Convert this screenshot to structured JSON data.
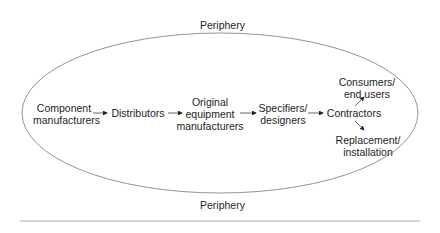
{
  "diagram": {
    "boundary_label_top": "Periphery",
    "boundary_label_bottom": "Periphery",
    "nodes": [
      {
        "id": "component",
        "lines": [
          "Component",
          "manufacturers"
        ]
      },
      {
        "id": "distributors",
        "lines": [
          "Distributors"
        ]
      },
      {
        "id": "oem",
        "lines": [
          "Original",
          "equipment",
          "manufacturers"
        ]
      },
      {
        "id": "specifiers",
        "lines": [
          "Specifiers/",
          "designers"
        ]
      },
      {
        "id": "contractors",
        "lines": [
          "Contractors"
        ]
      },
      {
        "id": "consumers",
        "lines": [
          "Consumers/",
          "end users"
        ]
      },
      {
        "id": "replacement",
        "lines": [
          "Replacement/",
          "installation"
        ]
      }
    ],
    "edges": [
      {
        "from": "component",
        "to": "distributors"
      },
      {
        "from": "distributors",
        "to": "oem"
      },
      {
        "from": "oem",
        "to": "specifiers"
      },
      {
        "from": "specifiers",
        "to": "contractors"
      },
      {
        "from": "contractors",
        "to": "consumers"
      },
      {
        "from": "contractors",
        "to": "replacement"
      }
    ],
    "colors": {
      "line": "#555555",
      "text": "#1e1e1e",
      "rule": "#999999"
    }
  }
}
